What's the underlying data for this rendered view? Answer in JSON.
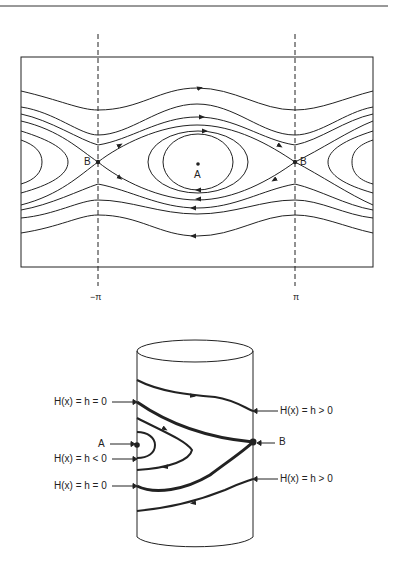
{
  "phase_portrait": {
    "saddle_label_left": "B",
    "saddle_label_right": "B",
    "center_label": "A",
    "axis_ticks": [
      "−π",
      "π"
    ]
  },
  "cylinder": {
    "labels": {
      "h_zero_top": "H(x) = h = 0",
      "h_pos_top": "H(x) = h > 0",
      "point_a": "A",
      "point_b": "B",
      "h_neg": "H(x) = h < 0",
      "h_zero_bottom": "H(x) = h = 0",
      "h_pos_bottom": "H(x) = h > 0"
    }
  },
  "colors": {
    "ink": "#222222",
    "background": "#ffffff"
  }
}
